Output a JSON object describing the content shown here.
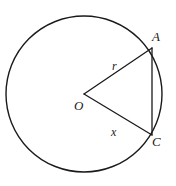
{
  "figure": {
    "kind": "circle-geometry-diagram",
    "background_color": "#ffffff",
    "stroke_color": "#1a1a1a",
    "text_color": "#1a1a1a",
    "canvas": {
      "width": 176,
      "height": 186
    },
    "circle": {
      "name": "circle",
      "center_x": 84,
      "center_y": 94,
      "radius": 78,
      "stroke_width": 1.4,
      "fill": "none"
    },
    "points": [
      {
        "id": "O",
        "label": "O",
        "x": 84,
        "y": 94,
        "role": "center"
      },
      {
        "id": "A",
        "label": "A",
        "x": 152,
        "y": 48,
        "role": "on-circle"
      },
      {
        "id": "C",
        "label": "C",
        "x": 152,
        "y": 135,
        "role": "on-circle"
      }
    ],
    "segments": [
      {
        "id": "OA",
        "label": "r",
        "from": "O",
        "to": "A",
        "kind": "radius",
        "x1": 84,
        "y1": 94,
        "x2": 152,
        "y2": 48
      },
      {
        "id": "OC",
        "label": "x",
        "from": "O",
        "to": "C",
        "kind": "radius",
        "x1": 84,
        "y1": 94,
        "x2": 152,
        "y2": 135
      },
      {
        "id": "AC",
        "label": "",
        "from": "A",
        "to": "C",
        "kind": "chord",
        "x1": 152,
        "y1": 48,
        "x2": 152,
        "y2": 135
      }
    ],
    "labels": {
      "point_a": "A",
      "point_c": "C",
      "point_o": "O",
      "radius_r": "r",
      "radius_x": "x"
    }
  }
}
